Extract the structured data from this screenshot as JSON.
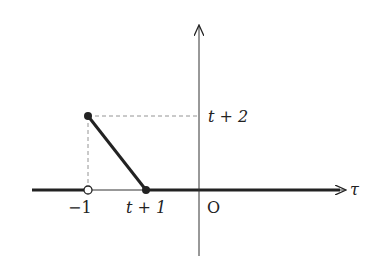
{
  "diagram": {
    "type": "function-graph",
    "axes": {
      "horizontal_label": "τ",
      "origin_label": "O"
    },
    "tick_labels": {
      "minus_one": "−1",
      "t_plus_one": "t + 1",
      "t_plus_two": "t + 2"
    },
    "points": [
      {
        "name": "(-1, 0)",
        "style": "open"
      },
      {
        "name": "(-1, t+2)",
        "style": "filled"
      },
      {
        "name": "(t+1, 0)",
        "style": "filled"
      }
    ],
    "segments": [
      {
        "from": "(-1, t+2)",
        "to": "(t+1, 0)",
        "style": "thick"
      },
      {
        "from": "-inf",
        "to": "-1",
        "style": "thick on axis"
      },
      {
        "from": "t+1",
        "to": "+inf",
        "style": "thick on axis"
      }
    ],
    "guides": [
      {
        "from": "(-1, t+2)",
        "to": "(0, t+2)",
        "style": "dashed"
      },
      {
        "from": "(-1, t+2)",
        "to": "(-1, 0)",
        "style": "dashed"
      }
    ],
    "colors": {
      "ink": "#222222",
      "guide": "#888888"
    }
  }
}
